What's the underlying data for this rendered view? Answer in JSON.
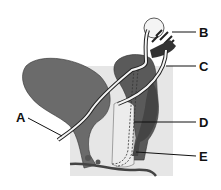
{
  "diagram": {
    "labels": [
      {
        "id": "A",
        "text": "A"
      },
      {
        "id": "B",
        "text": "B"
      },
      {
        "id": "C",
        "text": "C"
      },
      {
        "id": "D",
        "text": "D"
      },
      {
        "id": "E",
        "text": "E"
      }
    ],
    "colors": {
      "background_panel": "#e6e6e6",
      "organ_fill": "#6b6b6b",
      "dark_fill": "#4a4a4a",
      "tube": "#f2f2f2",
      "line": "#222222"
    }
  }
}
